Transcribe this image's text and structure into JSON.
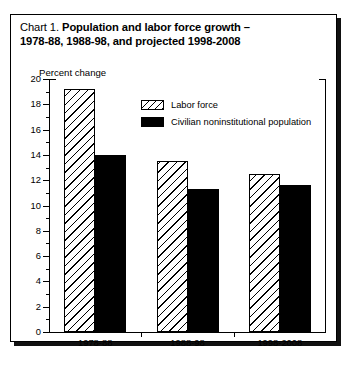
{
  "figure": {
    "title_lead": "Chart 1.",
    "title_bold_line1": "Population and labor force growth –",
    "title_bold_line2": "1978-88, 1988-98, and projected 1998-2008",
    "ylabel": "Percent change"
  },
  "legend": {
    "position": "inside-top-center",
    "entries": [
      {
        "label": "Labor force",
        "pattern": "diagonal-hatch",
        "color": "#ffffff"
      },
      {
        "label": "Civilian noninstitutional population",
        "pattern": "solid",
        "color": "#000000"
      }
    ]
  },
  "chart_data": {
    "type": "bar",
    "title": "Chart 1. Population and labor force growth – 1978-88, 1988-98, and projected 1998-2008",
    "xlabel": "",
    "ylabel": "Percent change",
    "ylim": [
      0,
      20
    ],
    "yticks": [
      0,
      2,
      4,
      6,
      8,
      10,
      12,
      14,
      16,
      18,
      20
    ],
    "ytick_labels": [
      "0",
      "2",
      "4",
      "6",
      "8",
      "10",
      "12",
      "14",
      "16",
      "18",
      "20"
    ],
    "yminor_ticks": [
      1,
      3,
      5,
      7,
      9,
      11,
      13,
      15,
      17,
      19
    ],
    "grid": false,
    "categories": [
      "1978-88",
      "1988-98",
      "1998-2008"
    ],
    "series": [
      {
        "name": "Labor force",
        "values": [
          19.2,
          13.5,
          12.5
        ]
      },
      {
        "name": "Civilian noninstitutional population",
        "values": [
          14.0,
          11.3,
          11.6
        ]
      }
    ]
  }
}
